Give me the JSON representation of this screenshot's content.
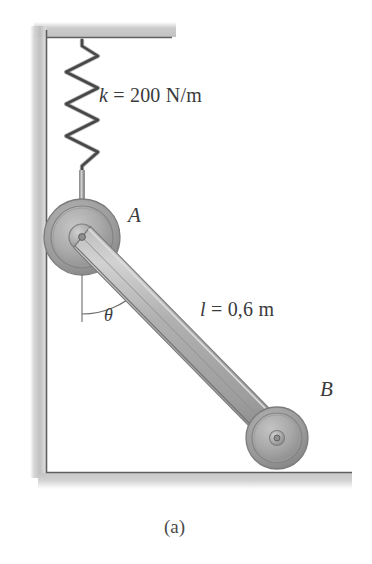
{
  "figure": {
    "caption": "(a)",
    "background_color": "#ffffff",
    "ink_color": "#3b3b3b"
  },
  "labels": {
    "spring_stiffness": {
      "symbol": "k",
      "equals": " = ",
      "value": "200 N/m",
      "full_text": "k = 200 N/m"
    },
    "bar_length": {
      "symbol": "l",
      "equals": " = ",
      "value": "0,6 m",
      "full_text": "l = 0,6 m"
    },
    "angle": {
      "symbol": "θ",
      "full_text": "θ"
    },
    "point_a": "A",
    "point_b": "B"
  },
  "components": {
    "wall": {
      "name": "vertical-wall",
      "line_color": "#5a5a5a",
      "hatch_color": "#b8b8b8"
    },
    "floor": {
      "name": "horizontal-floor",
      "line_color": "#5a5a5a",
      "hatch_color": "#b8b8b8"
    },
    "ceiling": {
      "name": "horizontal-ceiling",
      "line_color": "#5a5a5a",
      "hatch_color": "#b8b8b8"
    },
    "spring": {
      "name": "coil-spring",
      "coils": 7,
      "color": "#474747"
    },
    "rod": {
      "name": "spring-rod",
      "color": "#8c8c8c"
    },
    "roller_a": {
      "name": "roller-a",
      "center_x": 82,
      "center_y": 237,
      "outer_radius": 38,
      "fill": "#a9a9a9",
      "rim_fill": "#9a9a9a"
    },
    "roller_b": {
      "name": "roller-b",
      "center_x": 277,
      "center_y": 438,
      "outer_radius": 31,
      "fill": "#a9a9a9",
      "rim_fill": "#9a9a9a"
    },
    "bar": {
      "name": "connecting-bar",
      "from": "A",
      "to": "B",
      "fill": "#a8a8a8",
      "highlight": "#cfcfcf"
    },
    "angle_arc": {
      "name": "angle-arc",
      "vertex": "A",
      "reference": "vertical-line-down"
    }
  },
  "geometry": {
    "wall_x": 46,
    "ceiling_y": 37,
    "floor_y": 472,
    "ceiling_right_x": 172,
    "floor_right_x": 352,
    "spring_top_y": 40,
    "spring_bottom_y": 172,
    "spring_x": 82,
    "spring_amplitude": 16
  }
}
